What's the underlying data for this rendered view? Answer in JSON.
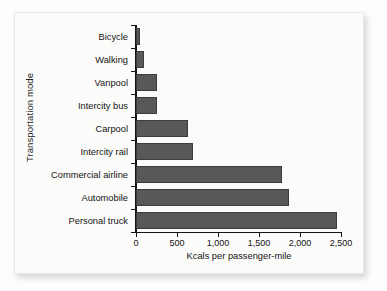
{
  "chart_data": {
    "type": "bar",
    "orientation": "horizontal",
    "title": "",
    "xlabel": "Kcals per passenger-mile",
    "ylabel": "Transportation mode",
    "categories": [
      "Bicycle",
      "Walking",
      "Vanpool",
      "Intercity bus",
      "Carpool",
      "Intercity rail",
      "Commercial airline",
      "Automobile",
      "Personal truck"
    ],
    "values": [
      50,
      100,
      250,
      250,
      640,
      700,
      1780,
      1860,
      2450
    ],
    "xlim": [
      0,
      2500
    ],
    "xticks": [
      0,
      500,
      1000,
      1500,
      2000,
      2500
    ],
    "xtick_labels": [
      "0",
      "500",
      "1,000",
      "1,500",
      "2,000",
      "2,500"
    ],
    "grid": false,
    "legend": false,
    "bar_color": "#585858",
    "bar_edge_color": "#3c3c3c",
    "axis_color": "#141414",
    "background_color": "#fbfbfa"
  }
}
